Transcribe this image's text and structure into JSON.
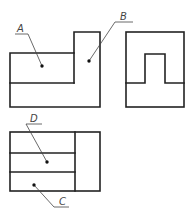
{
  "drawing": {
    "type": "orthographic-three-view",
    "views": [
      "front-view",
      "side-view",
      "top-view"
    ],
    "labels": {
      "a": "A",
      "b": "B",
      "c": "C",
      "d": "D"
    },
    "colors": {
      "line": "#222222",
      "leader": "#444444",
      "background": "#ffffff"
    }
  }
}
